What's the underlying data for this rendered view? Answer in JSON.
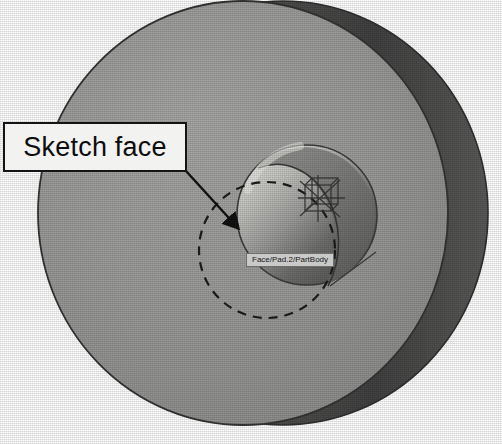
{
  "viewport": {
    "width": 502,
    "height": 444,
    "background": "#ffffff"
  },
  "annotation": {
    "callout_label": "Sketch face",
    "arrow": {
      "name": "leader-arrow",
      "from_x": 186,
      "from_y": 171,
      "to_x": 240,
      "to_y": 230
    }
  },
  "cad_tooltip": {
    "label": "Face/Pad.2/PartBody",
    "x": 246,
    "y": 253
  },
  "model": {
    "name": "cylindrical-disc-part",
    "front_face": {
      "name": "disc-front-face",
      "center_x": 243,
      "center_y": 213,
      "radius_x": 205,
      "radius_y": 212,
      "color": "#9a9a9a"
    },
    "rim": {
      "name": "disc-outer-rim",
      "color": "#4d4d4d",
      "highlight_color": "#6d6d6d"
    },
    "bore": {
      "name": "center-bore-pocket",
      "center_x": 307,
      "center_y": 215,
      "radius": 70,
      "light_color": "#d4d4d2",
      "dark_color": "#5c5c5c"
    },
    "selected_face": {
      "name": "selected-sketch-face",
      "center_x": 267,
      "center_y": 250,
      "radius": 68,
      "stroke": "#1c1c1c",
      "dash": "9 7"
    },
    "axis_system": {
      "name": "sketch-axis-system",
      "center_x": 318,
      "center_y": 198,
      "color": "#3a3a3a"
    }
  },
  "colors": {
    "face_gray": "#9a9a9a",
    "rim_dark": "#4d4d4d",
    "outline": "#2b2b2b",
    "label_bg": "#f2f2f0",
    "label_border": "#141414",
    "tooltip_bg": "#c9c9c9",
    "tooltip_border": "#6e6e6e"
  }
}
